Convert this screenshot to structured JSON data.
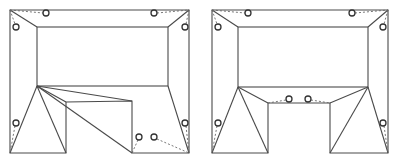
{
  "diagram": {
    "type": "roof-plan-comparison",
    "panels": [
      {
        "id": "left",
        "description": "U-shaped floor plan with asymmetric roof triangulation; drains on outer edges and in corner of notch",
        "outer": {
          "x1": 10,
          "y1": 10,
          "x2": 189,
          "y2": 153
        },
        "inner": {
          "x1": 37,
          "y1": 27,
          "x2": 168,
          "y2": 86
        },
        "notch": {
          "x1": 66,
          "y1": 101,
          "x2": 132,
          "y2": 153
        },
        "drains": [
          [
            46,
            13
          ],
          [
            154,
            13
          ],
          [
            16,
            27
          ],
          [
            185,
            27
          ],
          [
            16,
            123
          ],
          [
            185,
            123
          ],
          [
            139,
            137
          ],
          [
            154,
            137
          ]
        ]
      },
      {
        "id": "right",
        "description": "U-shaped floor plan with symmetric roof triangulation; drains on outer edges and at top of notch",
        "outer": {
          "x1": 212,
          "y1": 10,
          "x2": 388,
          "y2": 153
        },
        "inner": {
          "x1": 238,
          "y1": 27,
          "x2": 368,
          "y2": 87
        },
        "notch": {
          "x1": 268,
          "y1": 103,
          "x2": 330,
          "y2": 153
        },
        "drains": [
          [
            248,
            13
          ],
          [
            352,
            13
          ],
          [
            218,
            27
          ],
          [
            383,
            27
          ],
          [
            218,
            123
          ],
          [
            383,
            123
          ],
          [
            289,
            99
          ],
          [
            308,
            99
          ]
        ]
      }
    ],
    "colors": {
      "line": "#4a4a4a",
      "dash": "#6a6a6a",
      "circle": "#333333",
      "background": "#ffffff"
    }
  }
}
